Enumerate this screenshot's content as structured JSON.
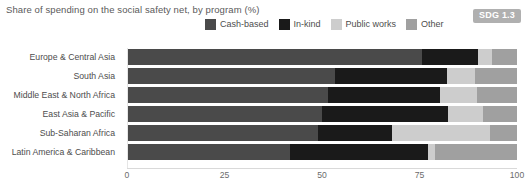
{
  "header": {
    "title": "Share of spending on the social safety net, by program (%)",
    "badge": "SDG 1.3"
  },
  "legend": {
    "position": "top-center",
    "items": [
      {
        "label": "Cash-based",
        "color": "#4a4a4a",
        "icon": "legend-swatch"
      },
      {
        "label": "In-kind",
        "color": "#1a1a1a",
        "icon": "legend-swatch"
      },
      {
        "label": "Public works",
        "color": "#cdcdcd",
        "icon": "legend-swatch"
      },
      {
        "label": "Other",
        "color": "#a0a0a0",
        "icon": "legend-swatch"
      }
    ]
  },
  "axis": {
    "ticks": [
      "0",
      "25",
      "50",
      "75",
      "100"
    ],
    "min": 0,
    "max": 100
  },
  "chart_data": {
    "type": "bar",
    "orientation": "horizontal",
    "stacked": true,
    "normalized_percent": true,
    "title": "Share of spending on the social safety net, by program (%)",
    "xlabel": "",
    "ylabel": "",
    "xlim": [
      0,
      100
    ],
    "xticks": [
      0,
      25,
      50,
      75,
      100
    ],
    "grid": false,
    "legend_position": "top-center",
    "categories": [
      "Europe & Central Asia",
      "South Asia",
      "Middle East & North Africa",
      "East Asia & Pacific",
      "Sub-Saharan Africa",
      "Latin America & Caribbean"
    ],
    "series": [
      {
        "name": "Cash-based",
        "color": "#4a4a4a",
        "values": [
          75.6,
          53.3,
          51.5,
          50.0,
          49.0,
          41.8
        ]
      },
      {
        "name": "In-kind",
        "color": "#1a1a1a",
        "values": [
          14.4,
          28.7,
          28.7,
          32.3,
          19.0,
          35.4
        ]
      },
      {
        "name": "Public works",
        "color": "#cdcdcd",
        "values": [
          3.6,
          7.2,
          9.5,
          9.0,
          25.1,
          1.8
        ]
      },
      {
        "name": "Other",
        "color": "#a0a0a0",
        "values": [
          6.4,
          10.8,
          10.3,
          8.7,
          6.9,
          21.0
        ]
      }
    ]
  }
}
